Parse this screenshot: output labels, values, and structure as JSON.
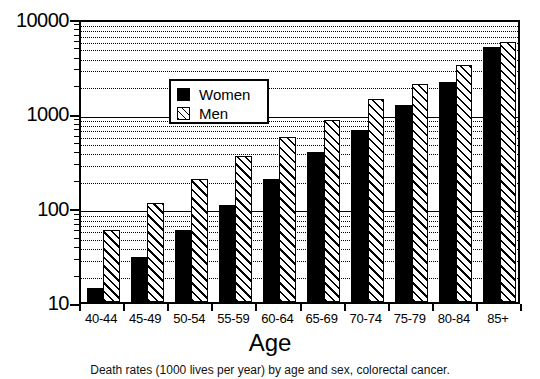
{
  "chart_data": {
    "type": "bar",
    "title": "",
    "xlabel": "Age",
    "ylabel": "",
    "yscale": "log",
    "ylim": [
      10,
      10000
    ],
    "grid": true,
    "legend_position": "upper-left-inside",
    "categories": [
      "40-44",
      "45-49",
      "50-54",
      "55-59",
      "60-64",
      "65-69",
      "70-74",
      "75-79",
      "80-84",
      "85+"
    ],
    "y_ticks": [
      10,
      100,
      1000,
      10000
    ],
    "y_tick_labels": [
      "10",
      "100",
      "1000",
      "10000"
    ],
    "series": [
      {
        "name": "Women",
        "fill": "solid-black",
        "values": [
          14,
          30,
          57,
          105,
          200,
          380,
          660,
          1200,
          2100,
          4900
        ]
      },
      {
        "name": "Men",
        "fill": "diagonal-hatch",
        "values": [
          58,
          112,
          200,
          350,
          560,
          840,
          1400,
          2000,
          3200,
          5600
        ]
      }
    ]
  },
  "legend": {
    "items": [
      {
        "label": "Women",
        "swatch": "solid-black-square-icon"
      },
      {
        "label": "Men",
        "swatch": "hatched-square-icon"
      }
    ]
  },
  "axis": {
    "x_title": "Age"
  },
  "caption": {
    "text": "Death rates (1000 lives per year) by age and sex, colorectal cancer."
  },
  "colors": {
    "foreground": "#000000",
    "background": "#ffffff"
  }
}
